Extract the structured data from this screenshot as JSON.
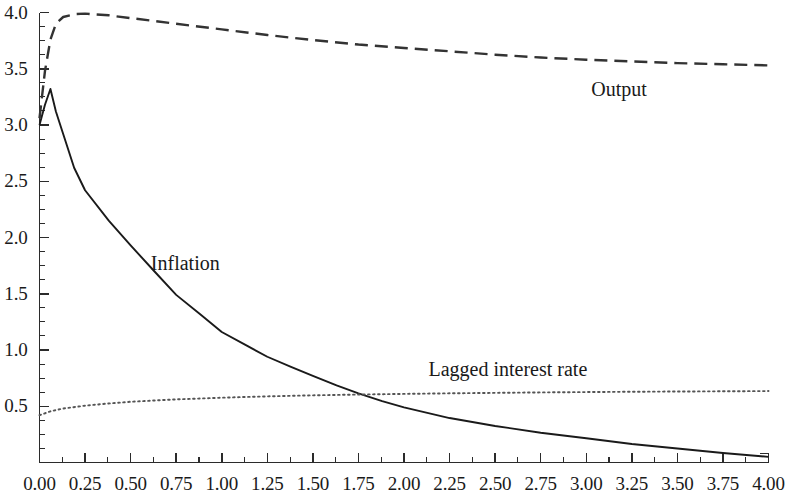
{
  "chart_data": {
    "type": "line",
    "title": "",
    "subtitle": "",
    "xlabel": "",
    "ylabel": "",
    "xlim": [
      0.0,
      4.0
    ],
    "ylim": [
      0.0,
      4.0
    ],
    "grid": false,
    "legend_position": "inline-annotations",
    "x_tick_labels": [
      "0.00",
      "0.25",
      "0.50",
      "0.75",
      "1.00",
      "1.25",
      "1.50",
      "1.75",
      "2.00",
      "2.25",
      "2.50",
      "2.75",
      "3.00",
      "3.25",
      "3.50",
      "3.75",
      "4.00"
    ],
    "x_tick_values": [
      0.0,
      0.25,
      0.5,
      0.75,
      1.0,
      1.25,
      1.5,
      1.75,
      2.0,
      2.25,
      2.5,
      2.75,
      3.0,
      3.25,
      3.5,
      3.75,
      4.0
    ],
    "x_minor_tick_step": 0.125,
    "y_tick_labels": [
      "0.5",
      "1.0",
      "1.5",
      "2.0",
      "2.5",
      "3.0",
      "3.5",
      "4.0"
    ],
    "y_tick_values": [
      0.5,
      1.0,
      1.5,
      2.0,
      2.5,
      3.0,
      3.5,
      4.0
    ],
    "y_minor_tick_step": 0.125,
    "series": [
      {
        "name": "Output",
        "style": "dashed",
        "color": "#333333",
        "annotation": "Output",
        "annotation_x": 3.18,
        "annotation_y": 3.32,
        "x": [
          0.0,
          0.03,
          0.06,
          0.09,
          0.13,
          0.19,
          0.25,
          0.38,
          0.5,
          0.63,
          0.75,
          1.0,
          1.25,
          1.5,
          1.75,
          2.0,
          2.25,
          2.5,
          2.75,
          3.0,
          3.25,
          3.5,
          3.75,
          4.0
        ],
        "y": [
          3.06,
          3.48,
          3.76,
          3.9,
          3.96,
          3.985,
          3.99,
          3.975,
          3.95,
          3.925,
          3.9,
          3.85,
          3.8,
          3.755,
          3.715,
          3.685,
          3.655,
          3.625,
          3.6,
          3.58,
          3.565,
          3.55,
          3.54,
          3.53
        ]
      },
      {
        "name": "Inflation",
        "style": "solid",
        "color": "#1a1a1a",
        "annotation": "Inflation",
        "annotation_x": 0.8,
        "annotation_y": 1.77,
        "x": [
          0.0,
          0.03,
          0.06,
          0.09,
          0.13,
          0.19,
          0.25,
          0.38,
          0.5,
          0.63,
          0.75,
          0.88,
          1.0,
          1.13,
          1.25,
          1.38,
          1.5,
          1.63,
          1.75,
          1.88,
          2.0,
          2.25,
          2.5,
          2.75,
          3.0,
          3.25,
          3.5,
          3.75,
          4.0
        ],
        "y": [
          3.0,
          3.18,
          3.32,
          3.12,
          2.92,
          2.62,
          2.42,
          2.15,
          1.93,
          1.7,
          1.49,
          1.32,
          1.16,
          1.045,
          0.94,
          0.85,
          0.77,
          0.685,
          0.615,
          0.545,
          0.49,
          0.395,
          0.325,
          0.265,
          0.215,
          0.165,
          0.125,
          0.085,
          0.05
        ]
      },
      {
        "name": "Lagged interest rate",
        "style": "dotted",
        "color": "#555555",
        "annotation": "Lagged interest rate",
        "annotation_x": 2.57,
        "annotation_y": 0.83,
        "x": [
          0.0,
          0.06,
          0.13,
          0.25,
          0.38,
          0.5,
          0.63,
          0.75,
          1.0,
          1.25,
          1.5,
          1.75,
          2.0,
          2.25,
          2.5,
          2.75,
          3.0,
          3.25,
          3.5,
          3.75,
          4.0
        ],
        "y": [
          0.42,
          0.455,
          0.48,
          0.505,
          0.525,
          0.54,
          0.551,
          0.561,
          0.576,
          0.588,
          0.597,
          0.604,
          0.61,
          0.615,
          0.619,
          0.623,
          0.626,
          0.629,
          0.631,
          0.633,
          0.635
        ]
      }
    ]
  },
  "axes": {
    "frame_color": "#2b2b2b",
    "background": "#ffffff"
  }
}
